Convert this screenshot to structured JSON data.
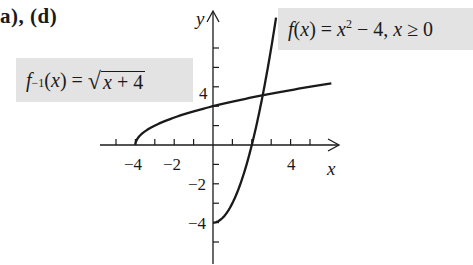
{
  "part_label": "a), (d)",
  "labels": {
    "f": {
      "name": "f",
      "arg": "(x)",
      "eq": " = ",
      "var": "x",
      "exp": "2",
      "rest": " − 4, ",
      "cond_var": "x",
      "cond": " ≥ 0"
    },
    "finv": {
      "name": "f",
      "exp": "−1",
      "arg": "(x)",
      "eq": " = ",
      "radicand_var": "x",
      "radicand_rest": " + 4"
    }
  },
  "axes": {
    "x_label": "x",
    "y_label": "y",
    "x_tick_labels": [
      "−4",
      "−2",
      "4"
    ],
    "y_tick_labels": [
      "4",
      "−2",
      "−4"
    ]
  },
  "chart_data": {
    "type": "line",
    "title": "",
    "xlabel": "x",
    "ylabel": "y",
    "xlim": [
      -5.5,
      6.5
    ],
    "ylim": [
      -6,
      7
    ],
    "grid": false,
    "x_ticks": [
      -5,
      -4,
      -3,
      -2,
      -1,
      1,
      2,
      3,
      4,
      5
    ],
    "x_tick_labels_shown": {
      "-4": "−4",
      "-2": "−2",
      "4": "4"
    },
    "y_ticks": [
      -5,
      -4,
      -3,
      -2,
      -1,
      1,
      2,
      3,
      4,
      5
    ],
    "y_tick_labels_shown": {
      "4": "4",
      "-2": "−2",
      "-4": "−4"
    },
    "series": [
      {
        "name": "f(x) = x^2 − 4, x ≥ 0",
        "domain": [
          0,
          3.25
        ],
        "x": [
          0,
          0.5,
          1,
          1.5,
          2,
          2.5,
          3,
          3.25
        ],
        "y": [
          -4,
          -3.75,
          -3,
          -1.75,
          0,
          2.25,
          5,
          6.5625
        ]
      },
      {
        "name": "f^-1(x) = sqrt(x + 4)",
        "domain": [
          -4,
          6.1
        ],
        "x": [
          -4,
          -3,
          -2,
          -1,
          0,
          1,
          2,
          3,
          4,
          5,
          6.1
        ],
        "y": [
          0,
          1,
          1.414,
          1.732,
          2,
          2.236,
          2.449,
          2.646,
          2.828,
          3,
          3.178
        ]
      }
    ],
    "annotations": [
      "f(x) = x^2 − 4, x ≥ 0",
      "f^-1(x) = √(x + 4)"
    ],
    "intersection": {
      "x": 2.56,
      "y": 2.56
    }
  }
}
